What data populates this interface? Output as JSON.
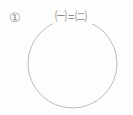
{
  "figure": {
    "domain": "diagram",
    "background_color": "#fdfdfd",
    "stroke_color": "#a9a9a9",
    "text_color": "#8d8d8d",
    "width": 133,
    "height": 115
  },
  "item_number": {
    "label": "①",
    "name": "circled-digit-one"
  },
  "relation": {
    "left_term": "㈠",
    "left_term_name": "circled-hangul-giyeok",
    "operator": "=",
    "right_term": "㈡",
    "right_term_name": "circled-hangul-nieun",
    "full_text": "㈠ = ㈡"
  },
  "shape": {
    "type": "circle",
    "center_x": 72.5,
    "center_y": 63.5,
    "radius": 44.5,
    "stroke_width": 0.8,
    "fill": "none"
  },
  "arc_gap": {
    "description": "top arc interrupted behind the labels",
    "start_x": 53,
    "end_x": 95,
    "y": 17
  }
}
